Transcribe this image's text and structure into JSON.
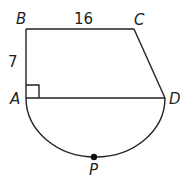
{
  "diagram": {
    "type": "geometry",
    "points": {
      "A": {
        "label": "A",
        "x": 26,
        "y": 98
      },
      "B": {
        "label": "B",
        "x": 26,
        "y": 29
      },
      "C": {
        "label": "C",
        "x": 134,
        "y": 29
      },
      "D": {
        "label": "D",
        "x": 165,
        "y": 98
      },
      "P": {
        "label": "P",
        "x": 94,
        "y": 157
      }
    },
    "measurements": {
      "BC": "16",
      "AB": "7"
    },
    "right_angle_at": "A",
    "colors": {
      "stroke": "#222222",
      "background": "#ffffff"
    }
  }
}
